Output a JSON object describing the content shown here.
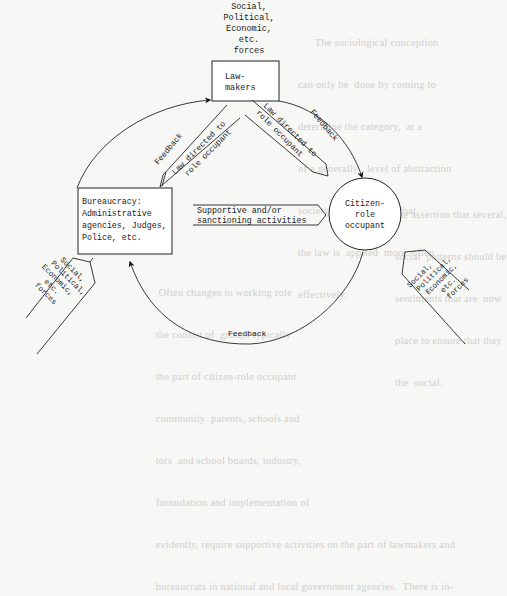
{
  "diagram": {
    "type": "flow-cycle",
    "nodes": {
      "lawmakers": {
        "label_lines": [
          "Law-",
          "makers"
        ]
      },
      "bureaucracy": {
        "label_lines": [
          "Bureaucracy:",
          "Administrative",
          "agencies, Judges,",
          "Police, etc."
        ]
      },
      "citizen": {
        "label_lines": [
          "Citizen-",
          "role",
          "occupant"
        ]
      }
    },
    "forces": {
      "label_lines": [
        "Social,",
        "Political,",
        "Economic,",
        "etc.",
        "forces"
      ]
    },
    "edges": {
      "law_to_bureaucracy": {
        "label_lines": [
          "Law directed to",
          "role occupant"
        ]
      },
      "law_to_citizen": {
        "label_lines": [
          "Law directed to",
          "role occupant"
        ]
      },
      "supportive": {
        "label_lines": [
          "Supportive and/or",
          "sanctioning activities"
        ]
      },
      "feedback_left": {
        "label": "Feedback"
      },
      "feedback_right": {
        "label": "Feedback"
      },
      "feedback_bottom": {
        "label": "Feedback"
      }
    }
  },
  "background_bleed": {
    "top_right": [
      "      The sociological conception",
      "can only be  done by coming to",
      "determine the category,  at a",
      "of a generally   level of abstraction",
      "society.  To  the extent that",
      "the law is  applied  more  often",
      "effectively."
    ],
    "middle_right": [
      "the assertion that several,",
      "social  patterns should be",
      "sentiments that are  now",
      "place to ensure that they",
      "the  social."
    ],
    "bottom_right": [
      "   Often changes in working role",
      "  the consist of  groups typically",
      "  the part of citizen-role occupant",
      "  community  parents, schools and",
      "  tors  and school boards, industry,",
      "  formulation and implementation of",
      "  evidently, require supportive activities on the part of lawmakers and",
      "  bureaucrats in national and local government agencies.  There is in-"
    ]
  }
}
